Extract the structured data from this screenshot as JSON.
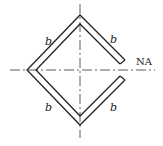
{
  "diagram": {
    "type": "thin-walled cross-section",
    "shape": "square tube rotated 45 degrees with slit on right vertex",
    "side_labels": [
      "b",
      "b",
      "b",
      "b"
    ],
    "axis_label": "NA",
    "colors": {
      "stroke": "#222222",
      "background": "#ffffff"
    }
  }
}
